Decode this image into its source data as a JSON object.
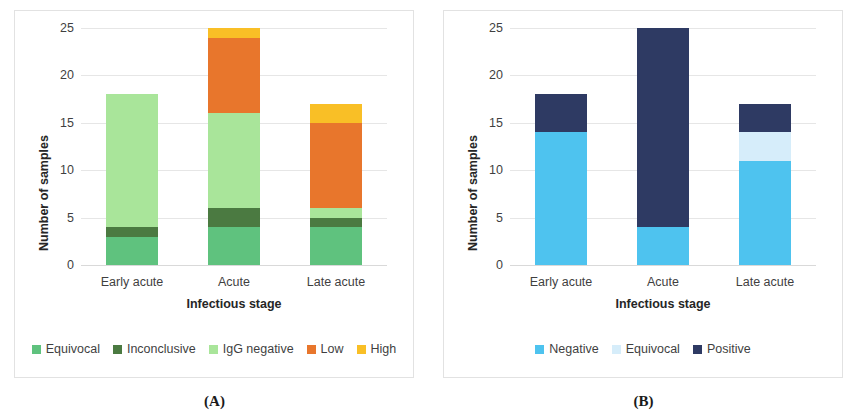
{
  "figure": {
    "panels": [
      {
        "caption": "(A)",
        "axis": {
          "ylabel": "Number of samples",
          "xlabel": "Infectious stage",
          "yticks": [
            "25",
            "20",
            "15",
            "10",
            "5",
            "0"
          ]
        }
      },
      {
        "caption": "(B)",
        "axis": {
          "ylabel": "Number of samples",
          "xlabel": "Infectious stage",
          "yticks": [
            "25",
            "20",
            "15",
            "10",
            "5",
            "0"
          ]
        }
      }
    ]
  },
  "chart_data": [
    {
      "type": "bar",
      "stacked": true,
      "panel": "(A)",
      "title": "",
      "xlabel": "Infectious stage",
      "ylabel": "Number of samples",
      "ylim": [
        0,
        25
      ],
      "ytick_values": [
        0,
        5,
        10,
        15,
        20,
        25
      ],
      "grid": true,
      "legend_position": "bottom",
      "categories": [
        "Early acute",
        "Acute",
        "Late acute"
      ],
      "series": [
        {
          "name": "Equivocal",
          "color": "#5fc27e",
          "values": [
            3,
            4,
            4
          ]
        },
        {
          "name": "Inconclusive",
          "color": "#4b7a41",
          "values": [
            1,
            2,
            1
          ]
        },
        {
          "name": "IgG negative",
          "color": "#a9e59a",
          "values": [
            14,
            10,
            1
          ]
        },
        {
          "name": "Low",
          "color": "#e8762c",
          "values": [
            0,
            8,
            9
          ]
        },
        {
          "name": "High",
          "color": "#f9bf26",
          "values": [
            0,
            1,
            2
          ]
        }
      ],
      "totals": [
        18,
        25,
        17
      ]
    },
    {
      "type": "bar",
      "stacked": true,
      "panel": "(B)",
      "title": "",
      "xlabel": "Infectious stage",
      "ylabel": "Number of samples",
      "ylim": [
        0,
        25
      ],
      "ytick_values": [
        0,
        5,
        10,
        15,
        20,
        25
      ],
      "grid": true,
      "legend_position": "bottom",
      "categories": [
        "Early acute",
        "Acute",
        "Late acute"
      ],
      "series": [
        {
          "name": "Negative",
          "color": "#4ec3ef",
          "values": [
            14,
            4,
            11
          ]
        },
        {
          "name": "Equivocal",
          "color": "#d6edfa",
          "values": [
            0,
            0,
            3
          ]
        },
        {
          "name": "Positive",
          "color": "#2e3a63",
          "values": [
            4,
            21,
            3
          ]
        }
      ],
      "totals": [
        18,
        25,
        17
      ]
    }
  ]
}
